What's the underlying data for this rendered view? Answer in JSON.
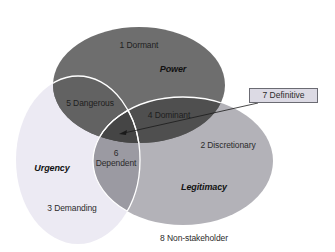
{
  "diagram": {
    "type": "venn",
    "sets": [
      {
        "name": "Power",
        "label": "Power",
        "color": "#6e6e6e"
      },
      {
        "name": "Urgency",
        "label": "Urgency",
        "color": "#eceaf3"
      },
      {
        "name": "Legitimacy",
        "label": "Legitimacy",
        "color": "#b3b2b8"
      }
    ],
    "regions": {
      "r1": "1 Dormant",
      "r2": "2 Discretionary",
      "r3": "3 Demanding",
      "r4": "4 Dominant",
      "r5": "5 Dangerous",
      "r6_num": "6",
      "r6_text": "Dependent",
      "r7": "7 Definitive",
      "r8": "8 Non-stakeholder"
    },
    "colors": {
      "power_urgency": "#626262",
      "power_legitimacy": "#4f4f4f",
      "urgency_legitimacy": "#9b9aa2",
      "all_three": "#454545",
      "outline": "#ffffff"
    }
  }
}
